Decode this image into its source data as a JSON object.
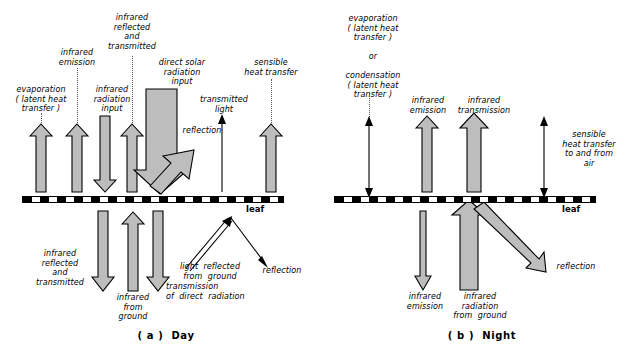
{
  "figure": {
    "title_a": "( a )  Day",
    "title_b": "( b )  Night",
    "leaf_label_a": "leaf",
    "leaf_label_b": "leaf"
  },
  "day": {
    "above": [
      {
        "id": "evaporation",
        "text": "evaporation\n( latent heat\ntransfer )",
        "dir": "up",
        "style": "block"
      },
      {
        "id": "infrared-emission",
        "text": "infrared\nemission",
        "dir": "up",
        "style": "block"
      },
      {
        "id": "infrared-radiation-input",
        "text": "infrared\nradiation\ninput",
        "dir": "down",
        "style": "block"
      },
      {
        "id": "infrared-reflected-transmitted",
        "text": "infrared\nreflected\nand\ntransmitted",
        "dir": "up",
        "style": "block"
      },
      {
        "id": "direct-solar-radiation-input",
        "text": "direct solar\nradiation\ninput",
        "dir": "down",
        "style": "block-wide"
      },
      {
        "id": "reflection",
        "text": "reflection",
        "dir": "up-right",
        "style": "block"
      },
      {
        "id": "transmitted-light",
        "text": "transmitted\nlight",
        "dir": "up",
        "style": "thin"
      },
      {
        "id": "sensible-heat-transfer",
        "text": "sensible\nheat transfer",
        "dir": "up",
        "style": "block"
      }
    ],
    "below": [
      {
        "id": "infrared-reflected-and-transmitted-down",
        "text": "infrared\nreflected\nand\ntransmitted",
        "dir": "down",
        "style": "block"
      },
      {
        "id": "infrared-from-ground",
        "text": "infrared\nfrom\nground",
        "dir": "up",
        "style": "block"
      },
      {
        "id": "transmission-of-direct-radiation",
        "text": "transmission\nof  direct  radiation",
        "dir": "down",
        "style": "block"
      },
      {
        "id": "light-reflected-from-ground",
        "text": "light  reflected\nfrom  ground",
        "dir": "up-right",
        "style": "double-thin"
      },
      {
        "id": "reflection-down",
        "text": "reflection",
        "dir": "down-right",
        "style": "thin"
      }
    ]
  },
  "night": {
    "above": [
      {
        "id": "evaporation-or-condensation",
        "text": "evaporation\n( latent heat\ntransfer )\n\nor\n\ncondensation\n( latent heat\ntransfer )",
        "dir": "both",
        "style": "thin"
      },
      {
        "id": "infrared-emission",
        "text": "infrared\nemission",
        "dir": "up",
        "style": "block"
      },
      {
        "id": "infrared-transmission",
        "text": "infrared\ntransmission",
        "dir": "up",
        "style": "block"
      },
      {
        "id": "sensible-heat-transfer-air",
        "text": "sensible\nheat transfer\nto and from\nair",
        "dir": "both",
        "style": "thin"
      }
    ],
    "below": [
      {
        "id": "infrared-emission-down",
        "text": "infrared\nemission",
        "dir": "down",
        "style": "thin-narrow"
      },
      {
        "id": "infrared-radiation-from-ground",
        "text": "infrared\nradiation\nfrom  ground",
        "dir": "up",
        "style": "block"
      },
      {
        "id": "reflection-night",
        "text": "reflection",
        "dir": "down-right",
        "style": "block-slim"
      }
    ]
  },
  "colors": {
    "arrow_fill": "#bdbdbd",
    "outline": "#000000",
    "leader": "#555555",
    "background": "#ffffff"
  }
}
